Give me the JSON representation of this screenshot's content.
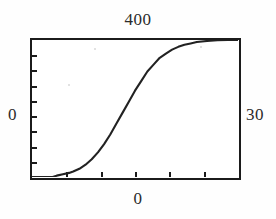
{
  "figure": {
    "title_top": "400",
    "label_left": "0",
    "label_right": "30",
    "label_bottom": "0",
    "clipped_left_glyph": "0"
  },
  "chart_data": {
    "type": "line",
    "title": "400",
    "xlabel": "0",
    "ylabel": "0",
    "right_label": "30",
    "grid": false,
    "legend": false,
    "xlim": [
      0,
      100
    ],
    "ylim": [
      0,
      100
    ],
    "axis_top_label": "400",
    "axis_left_label": "0",
    "axis_right_label": "30",
    "axis_bottom_label": "0",
    "x_tick_count": 5,
    "y_tick_count": 8,
    "series": [
      {
        "name": "cumulative-sigmoid",
        "x": [
          0,
          5,
          10,
          12,
          15,
          18,
          20,
          23,
          26,
          29,
          32,
          35,
          38,
          41,
          44,
          47,
          50,
          53,
          56,
          59,
          62,
          65,
          68,
          71,
          74,
          77,
          80,
          85,
          90,
          95,
          100
        ],
        "values": [
          0,
          0,
          0,
          1,
          2,
          3,
          4,
          6,
          9,
          13,
          18,
          24,
          31,
          39,
          47,
          55,
          63,
          70,
          77,
          82,
          87,
          90,
          93,
          95,
          96.5,
          97.5,
          98.5,
          99.3,
          99.8,
          100,
          100
        ]
      }
    ]
  }
}
